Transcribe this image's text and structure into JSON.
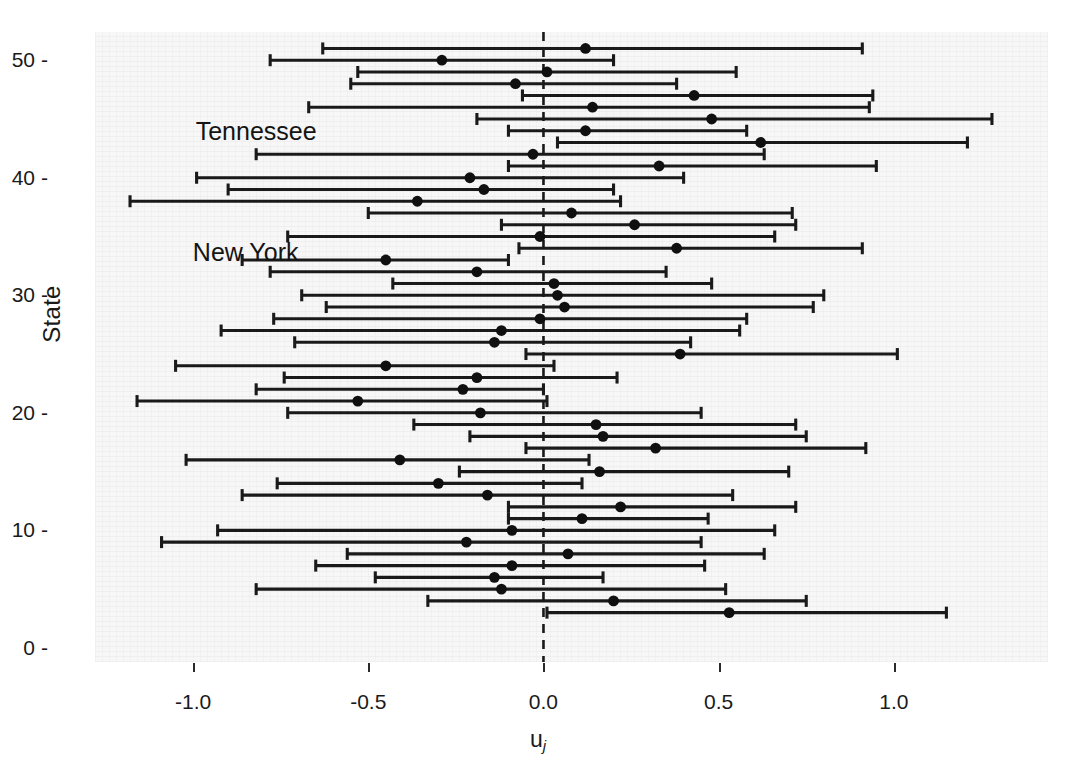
{
  "axes": {
    "ylabel": "State",
    "xlabel_base": "u",
    "xlabel_sub": "j",
    "y_ticks": [
      "0",
      "10",
      "20",
      "30",
      "40",
      "50"
    ],
    "y_tick_values": [
      0,
      10,
      20,
      30,
      40,
      50
    ],
    "x_ticks": [
      "-1.0",
      "-0.5",
      "0.0",
      "0.5",
      "1.0"
    ],
    "x_tick_values": [
      -1.0,
      -0.5,
      0.0,
      0.5,
      1.0
    ]
  },
  "annotations": [
    {
      "text": "Tennessee",
      "x": -0.82,
      "y": 44.0
    },
    {
      "text": "New York",
      "x": -0.85,
      "y": 33.7
    }
  ],
  "style": {
    "panel_fill": "#f7f7f7",
    "line_color": "#1a1a1a",
    "point_color": "#101010",
    "refline_color": "#1a1a1a"
  },
  "chart_data": {
    "type": "scatter",
    "title": "",
    "subtitle": "",
    "xlabel": "u_j",
    "ylabel": "State",
    "xlim": [
      -1.28,
      1.44
    ],
    "ylim": [
      -1.2,
      52.4
    ],
    "grid": false,
    "legend": null,
    "reference_line": {
      "x": 0.0,
      "style": "dashed"
    },
    "orientation": "horizontal",
    "series": [
      {
        "name": "u_j estimate with 95% interval",
        "marker": "filled-circle",
        "points": [
          {
            "y": 51,
            "estimate": 0.12,
            "low": -0.63,
            "high": 0.91
          },
          {
            "y": 50,
            "estimate": -0.29,
            "low": -0.78,
            "high": 0.2
          },
          {
            "y": 49,
            "estimate": 0.01,
            "low": -0.53,
            "high": 0.55
          },
          {
            "y": 48,
            "estimate": -0.08,
            "low": -0.55,
            "high": 0.38
          },
          {
            "y": 47,
            "estimate": 0.43,
            "low": -0.06,
            "high": 0.94
          },
          {
            "y": 46,
            "estimate": 0.14,
            "low": -0.67,
            "high": 0.93
          },
          {
            "y": 45,
            "estimate": 0.48,
            "low": -0.19,
            "high": 1.28
          },
          {
            "y": 44,
            "estimate": 0.12,
            "low": -0.1,
            "high": 0.58
          },
          {
            "y": 43,
            "estimate": 0.62,
            "low": 0.04,
            "high": 1.21
          },
          {
            "y": 42,
            "estimate": -0.03,
            "low": -0.82,
            "high": 0.63
          },
          {
            "y": 41,
            "estimate": 0.33,
            "low": -0.1,
            "high": 0.95
          },
          {
            "y": 40,
            "estimate": -0.21,
            "low": -0.99,
            "high": 0.4
          },
          {
            "y": 39,
            "estimate": -0.17,
            "low": -0.9,
            "high": 0.2
          },
          {
            "y": 38,
            "estimate": -0.36,
            "low": -1.18,
            "high": 0.22
          },
          {
            "y": 37,
            "estimate": 0.08,
            "low": -0.5,
            "high": 0.71
          },
          {
            "y": 36,
            "estimate": 0.26,
            "low": -0.12,
            "high": 0.72
          },
          {
            "y": 35,
            "estimate": -0.01,
            "low": -0.73,
            "high": 0.66
          },
          {
            "y": 34,
            "estimate": 0.38,
            "low": -0.07,
            "high": 0.91
          },
          {
            "y": 33,
            "estimate": -0.45,
            "low": -0.86,
            "high": -0.1
          },
          {
            "y": 32,
            "estimate": -0.19,
            "low": -0.78,
            "high": 0.35
          },
          {
            "y": 31,
            "estimate": 0.03,
            "low": -0.43,
            "high": 0.48
          },
          {
            "y": 30,
            "estimate": 0.04,
            "low": -0.69,
            "high": 0.8
          },
          {
            "y": 29,
            "estimate": 0.06,
            "low": -0.62,
            "high": 0.77
          },
          {
            "y": 28,
            "estimate": -0.01,
            "low": -0.77,
            "high": 0.58
          },
          {
            "y": 27,
            "estimate": -0.12,
            "low": -0.92,
            "high": 0.56
          },
          {
            "y": 26,
            "estimate": -0.14,
            "low": -0.71,
            "high": 0.42
          },
          {
            "y": 25,
            "estimate": 0.39,
            "low": -0.05,
            "high": 1.01
          },
          {
            "y": 24,
            "estimate": -0.45,
            "low": -1.05,
            "high": 0.03
          },
          {
            "y": 23,
            "estimate": -0.19,
            "low": -0.74,
            "high": 0.21
          },
          {
            "y": 22,
            "estimate": -0.23,
            "low": -0.82,
            "high": 0.0
          },
          {
            "y": 21,
            "estimate": -0.53,
            "low": -1.16,
            "high": 0.01
          },
          {
            "y": 20,
            "estimate": -0.18,
            "low": -0.73,
            "high": 0.45
          },
          {
            "y": 19,
            "estimate": 0.15,
            "low": -0.37,
            "high": 0.72
          },
          {
            "y": 18,
            "estimate": 0.17,
            "low": -0.21,
            "high": 0.75
          },
          {
            "y": 17,
            "estimate": 0.32,
            "low": -0.05,
            "high": 0.92
          },
          {
            "y": 16,
            "estimate": -0.41,
            "low": -1.02,
            "high": 0.13
          },
          {
            "y": 15,
            "estimate": 0.16,
            "low": -0.24,
            "high": 0.7
          },
          {
            "y": 14,
            "estimate": -0.3,
            "low": -0.76,
            "high": 0.11
          },
          {
            "y": 13,
            "estimate": -0.16,
            "low": -0.86,
            "high": 0.54
          },
          {
            "y": 12,
            "estimate": 0.22,
            "low": -0.1,
            "high": 0.72
          },
          {
            "y": 11,
            "estimate": 0.11,
            "low": -0.1,
            "high": 0.47
          },
          {
            "y": 10,
            "estimate": -0.09,
            "low": -0.93,
            "high": 0.66
          },
          {
            "y": 9,
            "estimate": -0.22,
            "low": -1.09,
            "high": 0.45
          },
          {
            "y": 8,
            "estimate": 0.07,
            "low": -0.56,
            "high": 0.63
          },
          {
            "y": 7,
            "estimate": -0.09,
            "low": -0.65,
            "high": 0.46
          },
          {
            "y": 6,
            "estimate": -0.14,
            "low": -0.48,
            "high": 0.17
          },
          {
            "y": 5,
            "estimate": -0.12,
            "low": -0.82,
            "high": 0.52
          },
          {
            "y": 4,
            "estimate": 0.2,
            "low": -0.33,
            "high": 0.75
          },
          {
            "y": 3,
            "estimate": 0.53,
            "low": 0.01,
            "high": 1.15
          }
        ]
      }
    ]
  }
}
